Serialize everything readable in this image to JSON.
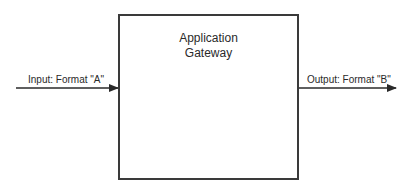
{
  "diagram": {
    "gateway": {
      "title_line1": "Application",
      "title_line2": "Gateway"
    },
    "input": {
      "label": "Input: Format \"A\"",
      "direction": "into-gateway"
    },
    "output": {
      "label": "Output: Format \"B\"",
      "direction": "out-of-gateway"
    },
    "colors": {
      "stroke": "#3a3a3a",
      "text": "#2a2a2a",
      "background": "#ffffff"
    }
  }
}
